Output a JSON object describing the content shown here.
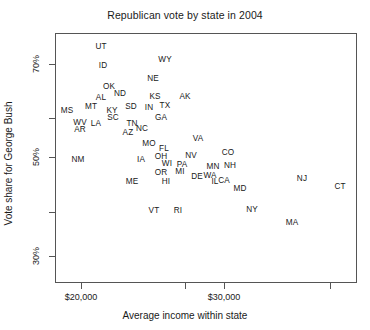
{
  "chart_data": {
    "type": "scatter",
    "title": "Republican vote by state in 2004",
    "xlabel": "Average income within state",
    "ylabel": "Vote share for George Bush",
    "grid": false,
    "legend": null,
    "marker_style": "text-label",
    "xlim": [
      17500,
      39000
    ],
    "ylim": [
      26,
      75
    ],
    "xticks": [
      20000,
      30000
    ],
    "xtick_labels": [
      "$20,000",
      "$30,000"
    ],
    "xticks_minor": [
      25000,
      35000
    ],
    "yticks": [
      30,
      50,
      70
    ],
    "ytick_labels": [
      "30%",
      "50%",
      "70%"
    ],
    "yticks_minor": [
      40,
      60
    ],
    "points": [
      {
        "label": "UT",
        "x": 21900,
        "y": 72.6
      },
      {
        "label": "ID",
        "x": 22050,
        "y": 68.4
      },
      {
        "label": "WY",
        "x": 26350,
        "y": 69.0
      },
      {
        "label": "NE",
        "x": 25550,
        "y": 65.9
      },
      {
        "label": "OK",
        "x": 22650,
        "y": 65.6
      },
      {
        "label": "ND",
        "x": 23350,
        "y": 62.9
      },
      {
        "label": "AL",
        "x": 22000,
        "y": 62.5
      },
      {
        "label": "KS",
        "x": 25600,
        "y": 62.0
      },
      {
        "label": "AK",
        "x": 27800,
        "y": 61.1
      },
      {
        "label": "TX",
        "x": 26450,
        "y": 61.1
      },
      {
        "label": "MT",
        "x": 21200,
        "y": 59.1
      },
      {
        "label": "SD",
        "x": 24150,
        "y": 59.9
      },
      {
        "label": "IN",
        "x": 25400,
        "y": 59.9
      },
      {
        "label": "KY",
        "x": 22800,
        "y": 59.5
      },
      {
        "label": "MS",
        "x": 19100,
        "y": 59.5
      },
      {
        "label": "SC",
        "x": 22900,
        "y": 58.0
      },
      {
        "label": "GA",
        "x": 26100,
        "y": 58.0
      },
      {
        "label": "LA",
        "x": 21100,
        "y": 56.7
      },
      {
        "label": "TN",
        "x": 23900,
        "y": 56.8
      },
      {
        "label": "NC",
        "x": 24700,
        "y": 56.0
      },
      {
        "label": "WV",
        "x": 20000,
        "y": 56.1
      },
      {
        "label": "AR",
        "x": 20100,
        "y": 54.3
      },
      {
        "label": "AZ",
        "x": 23600,
        "y": 54.9
      },
      {
        "label": "MO",
        "x": 24700,
        "y": 53.4
      },
      {
        "label": "VA",
        "x": 28900,
        "y": 53.7
      },
      {
        "label": "FL",
        "x": 26200,
        "y": 52.1
      },
      {
        "label": "OH",
        "x": 26000,
        "y": 50.8
      },
      {
        "label": "CO",
        "x": 31200,
        "y": 51.7
      },
      {
        "label": "NV",
        "x": 28400,
        "y": 50.5
      },
      {
        "label": "NM",
        "x": 20300,
        "y": 49.8
      },
      {
        "label": "IA",
        "x": 24000,
        "y": 49.9
      },
      {
        "label": "WI",
        "x": 25600,
        "y": 49.3
      },
      {
        "label": "PA",
        "x": 27500,
        "y": 48.4
      },
      {
        "label": "NH",
        "x": 31400,
        "y": 48.9
      },
      {
        "label": "MN",
        "x": 29100,
        "y": 47.6
      },
      {
        "label": "OR",
        "x": 25300,
        "y": 47.2
      },
      {
        "label": "MI",
        "x": 27200,
        "y": 47.8
      },
      {
        "label": "DE",
        "x": 28700,
        "y": 45.8
      },
      {
        "label": "WA",
        "x": 29300,
        "y": 45.6
      },
      {
        "label": "NJ",
        "x": 34300,
        "y": 46.2
      },
      {
        "label": "ME",
        "x": 23200,
        "y": 44.6
      },
      {
        "label": "HI",
        "x": 25800,
        "y": 45.3
      },
      {
        "label": "IL",
        "x": 29500,
        "y": 44.5
      },
      {
        "label": "CA",
        "x": 30100,
        "y": 44.4
      },
      {
        "label": "CT",
        "x": 37600,
        "y": 43.9
      },
      {
        "label": "MD",
        "x": 31500,
        "y": 42.9
      },
      {
        "label": "NY",
        "x": 32600,
        "y": 40.1
      },
      {
        "label": "VT",
        "x": 24500,
        "y": 38.8
      },
      {
        "label": "RI",
        "x": 25800,
        "y": 38.7
      },
      {
        "label": "MA",
        "x": 34000,
        "y": 36.8
      }
    ]
  },
  "layout": {
    "plot_positions": [
      {
        "label": "UT",
        "px": 100,
        "py": 46
      },
      {
        "label": "ID",
        "px": 102,
        "py": 65
      },
      {
        "label": "WY",
        "px": 164,
        "py": 59
      },
      {
        "label": "NE",
        "px": 152,
        "py": 78
      },
      {
        "label": "OK",
        "px": 108,
        "py": 86
      },
      {
        "label": "ND",
        "px": 119,
        "py": 93
      },
      {
        "label": "AL",
        "px": 100,
        "py": 97
      },
      {
        "label": "KS",
        "px": 154,
        "py": 96
      },
      {
        "label": "AK",
        "px": 184,
        "py": 96
      },
      {
        "label": "TX",
        "px": 164,
        "py": 105
      },
      {
        "label": "MT",
        "px": 90,
        "py": 106
      },
      {
        "label": "SD",
        "px": 130,
        "py": 106
      },
      {
        "label": "IN",
        "px": 148,
        "py": 107
      },
      {
        "label": "KY",
        "px": 111,
        "py": 110
      },
      {
        "label": "MS",
        "px": 66,
        "py": 110
      },
      {
        "label": "SC",
        "px": 112,
        "py": 117
      },
      {
        "label": "GA",
        "px": 160,
        "py": 117
      },
      {
        "label": "LA",
        "px": 95,
        "py": 123
      },
      {
        "label": "TN",
        "px": 131,
        "py": 123
      },
      {
        "label": "NC",
        "px": 141,
        "py": 128
      },
      {
        "label": "WV",
        "px": 79,
        "py": 122
      },
      {
        "label": "AR",
        "px": 79,
        "py": 129
      },
      {
        "label": "AZ",
        "px": 127,
        "py": 132
      },
      {
        "label": "MO",
        "px": 148,
        "py": 143
      },
      {
        "label": "VA",
        "px": 197,
        "py": 138
      },
      {
        "label": "FL",
        "px": 163,
        "py": 148
      },
      {
        "label": "OH",
        "px": 160,
        "py": 156
      },
      {
        "label": "CO",
        "px": 227,
        "py": 152
      },
      {
        "label": "NV",
        "px": 190,
        "py": 155
      },
      {
        "label": "NM",
        "px": 77,
        "py": 159
      },
      {
        "label": "IA",
        "px": 140,
        "py": 159
      },
      {
        "label": "WI",
        "px": 166,
        "py": 163
      },
      {
        "label": "PA",
        "px": 181,
        "py": 164
      },
      {
        "label": "NH",
        "px": 229,
        "py": 165
      },
      {
        "label": "MN",
        "px": 212,
        "py": 166
      },
      {
        "label": "OR",
        "px": 160,
        "py": 172
      },
      {
        "label": "MI",
        "px": 179,
        "py": 171
      },
      {
        "label": "DE",
        "px": 196,
        "py": 176
      },
      {
        "label": "WA",
        "px": 209,
        "py": 175
      },
      {
        "label": "NJ",
        "px": 301,
        "py": 178
      },
      {
        "label": "ME",
        "px": 131,
        "py": 181
      },
      {
        "label": "HI",
        "px": 165,
        "py": 181
      },
      {
        "label": "IL",
        "px": 214,
        "py": 181
      },
      {
        "label": "CA",
        "px": 223,
        "py": 180
      },
      {
        "label": "CT",
        "px": 339,
        "py": 186
      },
      {
        "label": "MD",
        "px": 239,
        "py": 188
      },
      {
        "label": "NY",
        "px": 251,
        "py": 209
      },
      {
        "label": "VT",
        "px": 153,
        "py": 210
      },
      {
        "label": "RI",
        "px": 177,
        "py": 210
      },
      {
        "label": "MA",
        "px": 291,
        "py": 222
      }
    ],
    "y_tick_marks": [
      {
        "label": "70%",
        "py": 64,
        "major": true
      },
      {
        "label": "",
        "py": 118,
        "major": false
      },
      {
        "label": "50%",
        "py": 157,
        "major": true
      },
      {
        "label": "",
        "py": 212,
        "major": false
      },
      {
        "label": "30%",
        "py": 256,
        "major": true
      }
    ],
    "x_tick_marks": [
      {
        "label": "$20,000",
        "px": 81,
        "major": true
      },
      {
        "label": "",
        "px": 185,
        "major": false
      },
      {
        "label": "$30,000",
        "px": 224,
        "major": true
      },
      {
        "label": "",
        "px": 330,
        "major": false
      }
    ]
  }
}
